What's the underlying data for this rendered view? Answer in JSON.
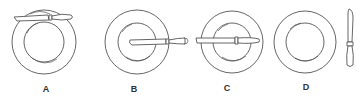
{
  "figure": {
    "options": [
      {
        "id": "A",
        "label": "A",
        "knife_position": "across top edge of plate, horizontal"
      },
      {
        "id": "B",
        "label": "B",
        "knife_position": "resting on right side of plate, blade toward center"
      },
      {
        "id": "C",
        "label": "C",
        "knife_position": "horizontal across middle of plate"
      },
      {
        "id": "D",
        "label": "D",
        "knife_position": "vertical, to the right of plate"
      }
    ]
  },
  "colors": {
    "stroke": "#555555",
    "background": "#ffffff",
    "label": "#333333"
  }
}
